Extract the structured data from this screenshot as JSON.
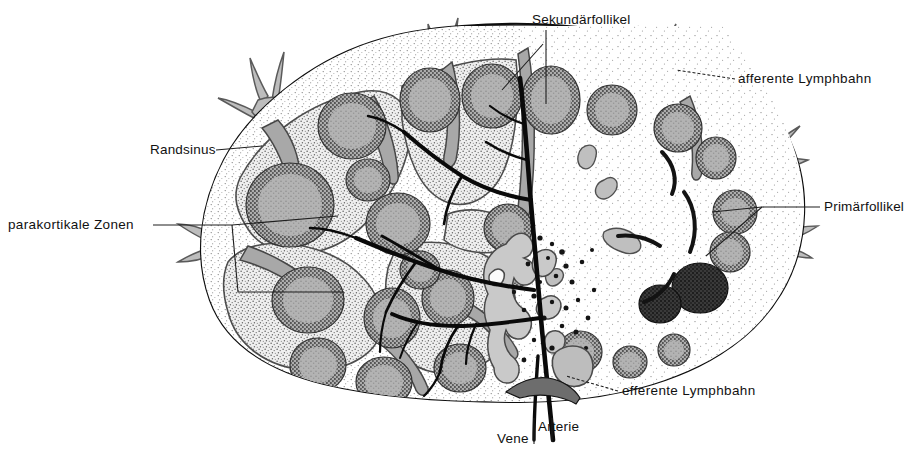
{
  "figure": {
    "title_semantic": "lymph-node-cross-section-diagram",
    "language": "de",
    "background_color": "#ffffff",
    "capsule_color": "#5a5a5a",
    "trabecula_color": "#9a9a9a",
    "follicle_fill": "#b0b0b0",
    "cortex_fill": "#f2f2f2",
    "medulla_fill": "#fbfbfb",
    "dark_follicle_fill": "#3a3a3a",
    "vessel_color": "#0a0a0a",
    "leader_color": "#222222",
    "text_color": "#111111"
  },
  "labels": [
    {
      "id": "sekundaerfollikel",
      "text": "Sekundärfollikel",
      "x": 532,
      "y": 12,
      "anchor": "left"
    },
    {
      "id": "afferente",
      "text": "afferente Lymphbahn",
      "x": 738,
      "y": 72,
      "anchor": "left"
    },
    {
      "id": "randsinus",
      "text": "Randsinus",
      "x": 150,
      "y": 143,
      "anchor": "left"
    },
    {
      "id": "parakortikale",
      "text": "parakortikale  Zonen",
      "x": 8,
      "y": 218,
      "anchor": "left"
    },
    {
      "id": "primaerfollikel",
      "text": "Primärfollikel",
      "x": 824,
      "y": 200,
      "anchor": "left"
    },
    {
      "id": "efferente",
      "text": "efferente Lymphbahn",
      "x": 622,
      "y": 384,
      "anchor": "left"
    },
    {
      "id": "arterie",
      "text": "Arterie",
      "x": 538,
      "y": 420,
      "anchor": "left"
    },
    {
      "id": "vene",
      "text": "Vene",
      "x": 498,
      "y": 432,
      "anchor": "left"
    }
  ],
  "structures": [
    {
      "name": "capsule",
      "label_de": "Kapsel",
      "count": 1
    },
    {
      "name": "subcapsular-sinus",
      "label_de": "Randsinus",
      "count": 1
    },
    {
      "name": "secondary-follicle",
      "label_de": "Sekundärfollikel",
      "count": 18
    },
    {
      "name": "primary-follicle",
      "label_de": "Primärfollikel",
      "count": 2
    },
    {
      "name": "paracortical-zone",
      "label_de": "parakortikale Zonen",
      "count": 6
    },
    {
      "name": "afferent-lymphatic",
      "label_de": "afferente Lymphbahn",
      "count": 6
    },
    {
      "name": "efferent-lymphatic",
      "label_de": "efferente Lymphbahn",
      "count": 1
    },
    {
      "name": "artery",
      "label_de": "Arterie",
      "count": 1
    },
    {
      "name": "vein",
      "label_de": "Vene",
      "count": 1
    },
    {
      "name": "medullary-cords",
      "label_de": "Medullarstränge",
      "count": 1
    },
    {
      "name": "trabecula",
      "label_de": "Trabekel",
      "count": 9
    }
  ]
}
